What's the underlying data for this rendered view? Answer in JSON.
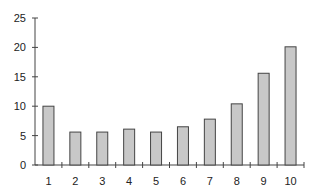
{
  "chart_data": {
    "type": "bar",
    "title": "",
    "xlabel": "",
    "ylabel": "",
    "categories": [
      "1",
      "2",
      "3",
      "4",
      "5",
      "6",
      "7",
      "8",
      "9",
      "10"
    ],
    "values": [
      10.0,
      5.6,
      5.6,
      6.1,
      5.6,
      6.5,
      7.8,
      10.4,
      15.6,
      20.1
    ],
    "ylim": [
      0,
      25
    ],
    "yticks": [
      0,
      5,
      10,
      15,
      20,
      25
    ],
    "grid": false,
    "legend": null,
    "colors": {
      "bar_fill": "#c8c8c8",
      "bar_stroke": "#444444",
      "axis": "#444444"
    }
  }
}
